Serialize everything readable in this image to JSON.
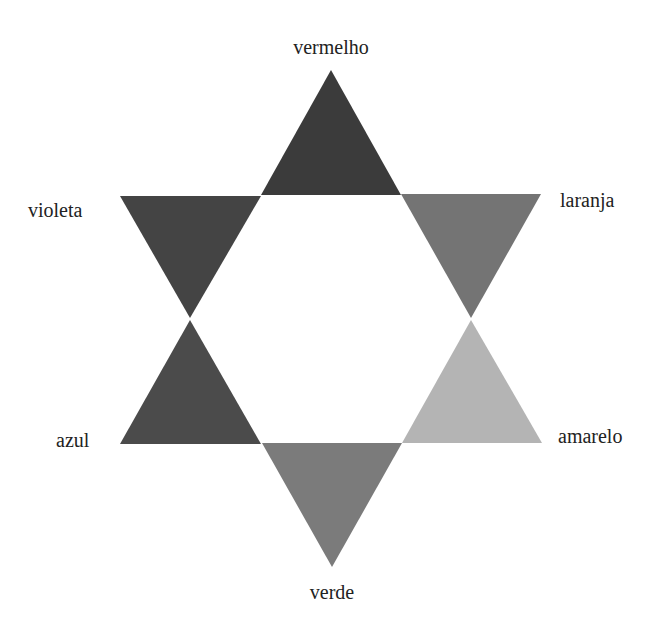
{
  "diagram": {
    "title": "",
    "type": "color-star",
    "segments": [
      {
        "id": "top",
        "label": "vermelho",
        "fill": "#3b3b3b",
        "points": "331,70 401,195 261,195",
        "label_pos": {
          "x": 331,
          "y": 37,
          "anchor": "center"
        }
      },
      {
        "id": "upper-right",
        "label": "laranja",
        "fill": "#747474",
        "points": "401,194 541,194 471,318",
        "label_pos": {
          "x": 560,
          "y": 190,
          "anchor": "left"
        }
      },
      {
        "id": "lower-right",
        "label": "amarelo",
        "fill": "#b4b4b4",
        "points": "471,320 542,443 402,443",
        "label_pos": {
          "x": 558,
          "y": 426,
          "anchor": "left"
        }
      },
      {
        "id": "bottom",
        "label": "verde",
        "fill": "#7b7b7b",
        "points": "262,443 402,443 332,567",
        "label_pos": {
          "x": 332,
          "y": 582,
          "anchor": "center"
        }
      },
      {
        "id": "lower-left",
        "label": "azul",
        "fill": "#4b4b4b",
        "points": "190,320 261,444 120,444",
        "label_pos": {
          "x": 56,
          "y": 430,
          "anchor": "left"
        }
      },
      {
        "id": "upper-left",
        "label": "violeta",
        "fill": "#444444",
        "points": "120,196 261,196 190,318",
        "label_pos": {
          "x": 28,
          "y": 200,
          "anchor": "left"
        }
      }
    ]
  }
}
